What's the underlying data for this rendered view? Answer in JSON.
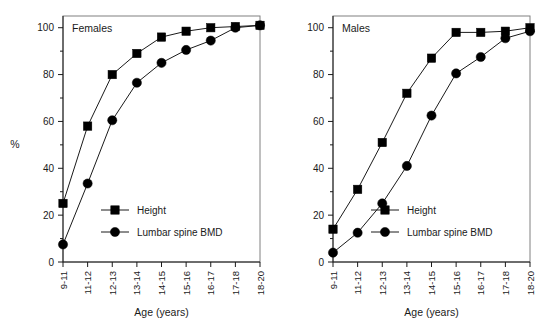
{
  "figure": {
    "panels": [
      "Females",
      "Males"
    ]
  },
  "chart_data": [
    {
      "type": "line",
      "title": "Females",
      "xlabel": "Age (years)",
      "ylabel": "%",
      "categories": [
        "9-11",
        "11-12",
        "12-13",
        "13-14",
        "14-15",
        "15-16",
        "16-17",
        "17-18",
        "18-20"
      ],
      "ylim": [
        0,
        105
      ],
      "yticks": [
        0,
        20,
        40,
        60,
        80,
        100
      ],
      "ytick_labels": [
        "0",
        "20",
        "40",
        "60",
        "80",
        "100"
      ],
      "yminor_ticks": [
        10,
        30,
        50,
        70,
        90
      ],
      "grid": false,
      "legend_position": "lower-center",
      "series": [
        {
          "name": "Height",
          "marker": "square",
          "values": [
            25,
            58,
            80,
            89,
            96,
            98.5,
            100,
            100.5,
            101
          ]
        },
        {
          "name": "Lumbar spine BMD",
          "marker": "circle",
          "values": [
            7.5,
            33.5,
            60.5,
            76.5,
            85,
            90.5,
            94.5,
            100,
            101
          ]
        }
      ]
    },
    {
      "type": "line",
      "title": "Males",
      "xlabel": "Age (years)",
      "ylabel": "",
      "categories": [
        "9-11",
        "11-12",
        "12-13",
        "13-14",
        "14-15",
        "15-16",
        "16-17",
        "17-18",
        "18-20"
      ],
      "ylim": [
        0,
        105
      ],
      "yticks": [
        0,
        20,
        40,
        60,
        80,
        100
      ],
      "ytick_labels": [
        "0",
        "20",
        "40",
        "60",
        "80",
        "100"
      ],
      "yminor_ticks": [
        10,
        30,
        50,
        70,
        90
      ],
      "grid": false,
      "legend_position": "lower-center",
      "series": [
        {
          "name": "Height",
          "marker": "square",
          "values": [
            14,
            31,
            51,
            72,
            87,
            98,
            98,
            98.5,
            100
          ]
        },
        {
          "name": "Lumbar spine BMD",
          "marker": "circle",
          "values": [
            4,
            12.5,
            25,
            41,
            62.5,
            80.5,
            87.5,
            95.5,
            98.5
          ]
        }
      ]
    }
  ],
  "left_panel": {
    "title": "Females",
    "ylabel": "%",
    "xlabel": "Age (years)",
    "ytick_labels": [
      "0",
      "20",
      "40",
      "60",
      "80",
      "100"
    ],
    "xtick_labels": [
      "9-11",
      "11-12",
      "12-13",
      "13-14",
      "14-15",
      "15-16",
      "16-17",
      "17-18",
      "18-20"
    ],
    "legend": [
      {
        "label": "Height",
        "marker": "square"
      },
      {
        "label": "Lumbar spine BMD",
        "marker": "circle"
      }
    ]
  },
  "right_panel": {
    "title": "Males",
    "ylabel": "",
    "xlabel": "Age (years)",
    "ytick_labels": [
      "0",
      "20",
      "40",
      "60",
      "80",
      "100"
    ],
    "xtick_labels": [
      "9-11",
      "11-12",
      "12-13",
      "13-14",
      "14-15",
      "15-16",
      "16-17",
      "17-18",
      "18-20"
    ],
    "legend": [
      {
        "label": "Height",
        "marker": "square"
      },
      {
        "label": "Lumbar spine BMD",
        "marker": "circle"
      }
    ]
  },
  "colors": {
    "marker": "#000000",
    "line": "#1a1a1a",
    "frame": "#808080",
    "text": "#1a1a1a",
    "background": "#ffffff"
  }
}
